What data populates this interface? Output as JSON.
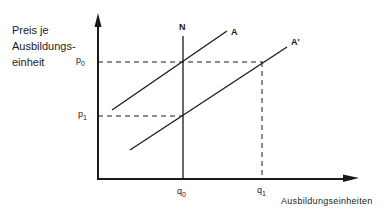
{
  "diagram": {
    "y_axis_label_lines": [
      "Preis je",
      "Ausbildungs-",
      "einheit"
    ],
    "x_axis_label": "Ausbildungseinheiten",
    "price_ticks": {
      "p0": "p",
      "p0_sub": "0",
      "p1": "p",
      "p1_sub": "1"
    },
    "quantity_ticks": {
      "q0": "q",
      "q0_sub": "0",
      "q1": "q",
      "q1_sub": "1"
    },
    "curves": {
      "demand": "N",
      "supply": "A",
      "supply_shifted": "A'"
    },
    "colors": {
      "ink": "#1a1a1a",
      "background": "#ffffff"
    }
  }
}
